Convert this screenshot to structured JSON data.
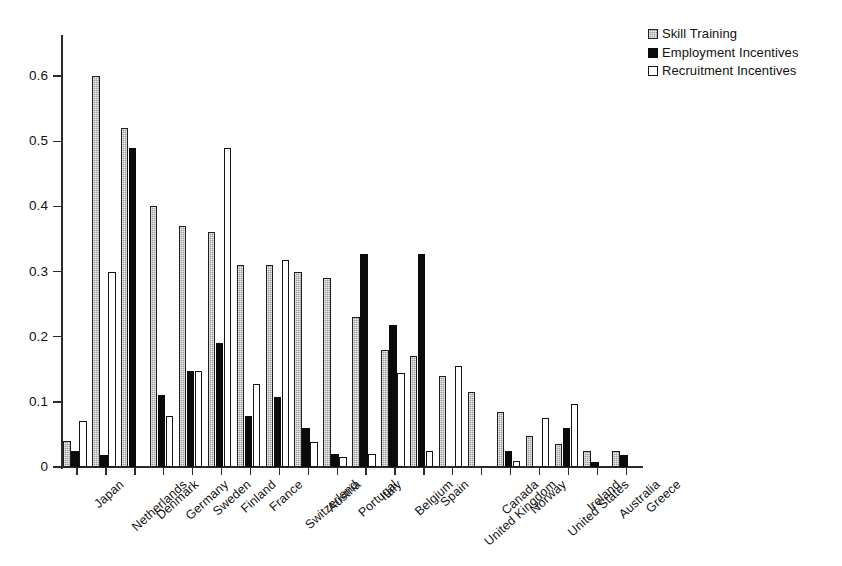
{
  "chart_data": {
    "type": "bar",
    "title": "",
    "subtitle": "",
    "xlabel": "",
    "ylabel": "",
    "ylim": [
      0,
      0.66
    ],
    "yticks": [
      "0",
      "0.1",
      "0.2",
      "0.3",
      "0.4",
      "0.5",
      "0.6"
    ],
    "ytick_values": [
      0,
      0.1,
      0.2,
      0.3,
      0.4,
      0.5,
      0.6
    ],
    "grid": false,
    "legend_position": "top-right",
    "categories": [
      "Japan",
      "Netherlands",
      "Denmark",
      "Germany",
      "Sweden",
      "Finland",
      "France",
      "Switzerland",
      "Austria",
      "Portugal",
      "Italy",
      "Belgium",
      "Spain",
      "United Kingdom",
      "Canada",
      "Norway",
      "United States",
      "Ireland",
      "Australia",
      "Greece"
    ],
    "series": [
      {
        "name": "Skill Training",
        "color": "#9c9c9c",
        "fill": "hatched-grey",
        "values": [
          0.04,
          0.6,
          0.52,
          0.4,
          0.37,
          0.36,
          0.31,
          0.31,
          0.3,
          0.29,
          0.23,
          0.18,
          0.17,
          0.14,
          0.115,
          0.085,
          0.047,
          0.035,
          0.025,
          0.025
        ]
      },
      {
        "name": "Employment Incentives",
        "color": "#0b0b0b",
        "fill": "solid-black",
        "values": [
          0.025,
          0.018,
          0.49,
          0.11,
          0.148,
          0.19,
          0.078,
          0.108,
          0.06,
          0.02,
          0.327,
          0.218,
          0.327,
          0.0,
          0.0,
          0.025,
          0.0,
          0.06,
          0.007,
          0.018
        ]
      },
      {
        "name": "Recruitment Incentives",
        "color": "#ffffff",
        "fill": "white-outline",
        "values": [
          0.07,
          0.3,
          0.0,
          0.078,
          0.147,
          0.49,
          0.127,
          0.318,
          0.038,
          0.015,
          0.02,
          0.145,
          0.025,
          0.155,
          0.0,
          0.01,
          0.075,
          0.097,
          0.0,
          0.0
        ]
      }
    ]
  },
  "legend": {
    "items": [
      {
        "label": "Skill Training",
        "swatch": "skill"
      },
      {
        "label": "Employment Incentives",
        "swatch": "employment"
      },
      {
        "label": "Recruitment Incentives",
        "swatch": "recruitment"
      }
    ]
  }
}
